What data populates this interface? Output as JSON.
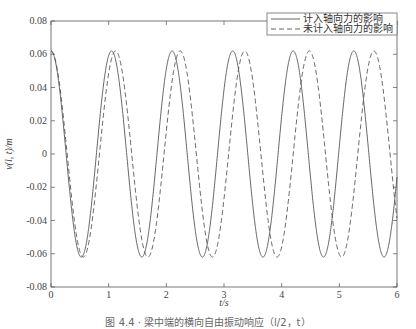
{
  "chart_data": {
    "type": "line",
    "title": "",
    "xlabel": "t/s",
    "ylabel": "v(l, t)/m",
    "xlim": [
      0,
      6
    ],
    "ylim": [
      -0.08,
      0.08
    ],
    "xticks": [
      0,
      1,
      2,
      3,
      4,
      5,
      6
    ],
    "yticks": [
      0.08,
      0.06,
      0.04,
      0.02,
      0,
      -0.02,
      -0.04,
      -0.06,
      -0.08
    ],
    "ytick_labels": [
      "0.08",
      "0.06",
      "0.04",
      "0.02",
      "0",
      "-0.02",
      "-0.04",
      "-0.06",
      "-0.08"
    ],
    "grid": false,
    "legend_position": "upper right",
    "series": [
      {
        "name": "计入轴向力的影响",
        "style": "solid",
        "amplitude": 0.062,
        "period": 1.05,
        "peaks_t": [
          0,
          1.05,
          2.1,
          3.15,
          4.2,
          5.25
        ],
        "troughs_t": [
          0.52,
          1.57,
          2.62,
          3.67,
          4.72,
          5.77
        ]
      },
      {
        "name": "未计入轴向力的影响",
        "style": "dashed",
        "amplitude": 0.062,
        "period": 1.12,
        "peaks_t": [
          0,
          1.12,
          2.24,
          3.36,
          4.48,
          5.6
        ],
        "troughs_t": [
          0.56,
          1.68,
          2.8,
          3.92,
          5.04
        ]
      }
    ]
  },
  "legend": {
    "items": [
      {
        "label": "计入轴向力的影响",
        "style": "solid"
      },
      {
        "label": "未计入轴向力的影响",
        "style": "dashed"
      }
    ]
  },
  "caption": "图 4.4 · 梁中端的横向自由振动响应（l/2，t）",
  "colors": {
    "line": "#555555",
    "axis": "#555555"
  }
}
